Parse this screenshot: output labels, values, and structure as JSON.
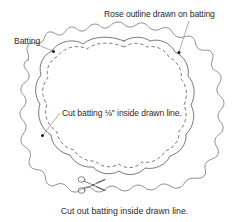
{
  "figure": {
    "kind": "instructional-line-diagram",
    "background_color": "#ffffff",
    "ink_color": "#4a4a4a",
    "text_color": "#2b2b2b"
  },
  "labels": {
    "rose_outline": "Rose outline drawn on batting",
    "batting": "Batting",
    "cut_inside_prefix": "Cut batting ",
    "cut_inside_fraction": "⅛",
    "cut_inside_suffix": "\" inside drawn line."
  },
  "caption": {
    "bottom": "Cut out batting inside drawn line."
  },
  "icons": {
    "scissors": "scissors-icon",
    "leader_dot": "leader-dot-marker"
  },
  "lines": {
    "batting_edge": {
      "name": "batting-outer-edge",
      "style": "solid",
      "description": "irregular wavy torn edge of the batting square"
    },
    "rose_outline": {
      "name": "rose-drawn-outline",
      "style": "solid",
      "description": "scalloped lobed rose shape drawn on the batting"
    },
    "cut_line": {
      "name": "cut-dashed-line",
      "style": "dashed",
      "description": "dashed line 1/8 inch inside the drawn rose outline"
    }
  },
  "leaders": [
    {
      "name": "leader-rose-outline",
      "from_label": "rose_outline",
      "to_point": "top-right of rose outline"
    },
    {
      "name": "leader-batting",
      "from_label": "batting",
      "to_point": "upper-left batting edge"
    },
    {
      "name": "leader-cut-inside",
      "from_label": "cut_inside",
      "to_point": "left side of dashed cut line"
    }
  ]
}
